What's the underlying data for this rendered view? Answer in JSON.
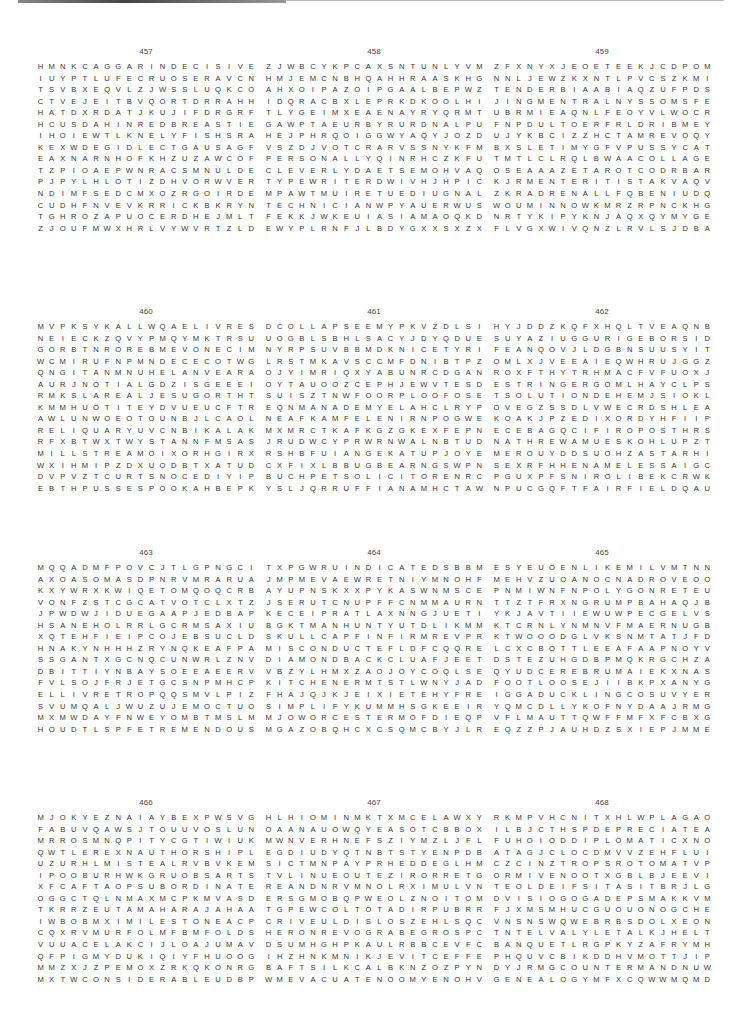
{
  "puzzles": [
    {
      "number": "457",
      "rows": [
        "HMNKCAGGARINDECISIVE",
        "IUYPTLUFECRUOSERAVCN",
        "TSVBXEQVLZJWSSLUQKCO",
        "CTVEJEITBVQORTDRRAHH",
        "HATDXRDATJKUJIFDRGRF",
        "HCUSDAHINREDBREASTIE",
        "IHOIEWTLKNELYFISHSRA",
        "KEXWDEGIDLECTGAUSAGF",
        "EAXNARNHOFKHZUZAWCOF",
        "TZPIOAEPWNRACSMNULDE",
        "PJPYLHLOTIZDHVORWVER",
        "NDIMFSEDCMXOZRGOIRDE",
        "CUDHFNVEVKRRICKBKRYN",
        "TGHROZAPUOCERDHEJMLT",
        "ZJOUFMWXHRLVYWVRTZLD"
      ]
    },
    {
      "number": "458",
      "rows": [
        "ZJWBCYKPCAXSNTUNLYVM",
        "HMJEMCNBHQAHHRAASKHG",
        "AHXOIPAZOIPGAALBEPWZ",
        "IDQRACBXLEPRKDKOOLHI",
        "TLYGEIMXEAENAYRYQRMT",
        "GAWPTAEURBYRURDNALPU",
        "HEJPHRQOIGGWYAQYJOZD",
        "VSZDJVOTCRARVSSNYKFM",
        "PERSONALLYQINRHCZKFU",
        "CLEVERLYDAETSEMOHVAQ",
        "TYPEWRITERDWIVHJHPIC",
        "MPAWTMUIRETUEDIUGNAL",
        "TECHNICIANWPYAUERWUS",
        "FEKKJWKEUIASIAMAOQKD",
        "EWYPLRNFJLBDYGXXSXZX"
      ]
    },
    {
      "number": "459",
      "rows": [
        "ZFXNYXJEOETEEKJCDPOM",
        "NNLJEWZKXNTLPVCSZKMI",
        "TENDERBIAABIAQZUFPDS",
        "JINGMENTRALNYSSOMSFE",
        "UBRMIEAQNLFEOYVLWOCR",
        "FNPDULTOERFRLDRIBMEY",
        "UJYKBCIZZHCTAMREVOQY",
        "BXSLETIMYGFVPUSSYCAT",
        "TMTLCLRQLBWAACOLLAGE",
        "OSEAAAZETAROTCODRBAR",
        "KJRMENTERITISTAKVAQV",
        "ZKRADRENALLFQBENIUDQ",
        "WOUMINNOWKMRZRPNCKHG",
        "NRTYKIPYKNJAQXQYMYGE",
        "FLVGXWIVQNZLRVLSJDBA"
      ]
    },
    {
      "number": "460",
      "rows": [
        "MVPKSYKALLWQAELIVRES",
        "NEIECKZQVYPMQYMKTRSU",
        "GORBTNROREBMEVONECIM",
        "WCMIRUFNPMNDECECOTWG",
        "QNGITANMNUHELANVEARA",
        "AURJNOTIALGDZISGEEEI",
        "RMKSLAREALJESUGORTHT",
        "KMMHUOTITEYDVUEUCFTR",
        "AWLUNWOEOTOUNBJLCAOL",
        "RELIQUARYUVCNBIKALAK",
        "RFXBTWXTWYSTANNFMSAS",
        "MILLSTREAMOIXORHGIRX",
        "WXIHMIPZDXUODBTXATUD",
        "DVPVZTCURTSNOCEDIYIP",
        "EBTHPUSSESPOOKAHBEPK"
      ]
    },
    {
      "number": "461",
      "rows": [
        "DCOLLAPSEEMYPKVZDLSI",
        "UOGBLSBHLSACYJDYQDUE",
        "NYRPSUVBBMDKNICETYRI",
        "LRSTMKAVSCCMFDNIBTPZ",
        "OJYIMRIQXYABUNRCDGAN",
        "OYTAUOOZCEPHJEWVTESD",
        "SUISZTNWFOORPLOOFOSE",
        "EQNMANADEMYELAHCLRYP",
        "NEAFKAMFELENIRNPOGWE",
        "MXMRCTKAFKGZGKEXFEPN",
        "JRUDWCYPRWRNWALNBTUD",
        "RSHBFUIANGEKATUPJOYE",
        "CXFIXLBBUGBEARNGSWPN",
        "BUCHPETSOLICITORENRC",
        "YSLJQRRUFFIANAMHCTAWY"
      ]
    },
    {
      "number": "462",
      "rows": [
        "HYJDDZKQFXHQLTVEAQNB",
        "SUYAZIUGGURIGEBORSID",
        "FEANQOVJLDGBNSUUSYIT",
        "OMLXJVEEAIEQWHRUJGGZ",
        "ROXFTHYTRHMACFVFUOXJ",
        "ESTRINGERGOMLHAYCLPS",
        "TSOLUTIONDEHEMJSIOKL",
        "OVEGZSSDLVWECRDSHLEA",
        "KOAKJPZEDIXORDYHFIIP",
        "ECEBAGQCIFIROPOSTHRS",
        "NATHREWAMUESKOHLUPZT",
        "MEROUYDDSUOHZASTARHI",
        "SEXRFHHENAMELESSAIGC",
        "PGUXPFSNIROLIBEKCRWK",
        "NPUCGQFTFAIRFIELDQAU"
      ]
    },
    {
      "number": "463",
      "rows": [
        "MQQADMFPOVCJTLGPNGCI",
        "AXOASOMASDPNRVMRARUA",
        "KXYWRXKWIQETOMQOQCRB",
        "VONFZSTCGCATVOTCLXTZ",
        "JPWDWJIDUEGAAPJEDBAP",
        "HSANEHOLRRLGCRMSAXIU",
        "XQTEHFIEIPCOJEBSUCLD",
        "HNAKYNHHHZRYNQKEAFPA",
        "SSGANTXGCNQCUNWRLZNV",
        "DBITTIYNBAYSOEEAEERV",
        "FVLSOJFRJETGCSNPMHCP",
        "ELLIVRETROPQQSMVLPIZ",
        "SVUMQALJWUZUJEMOCTUO",
        "MXMWDAYFNWEYOMBTMSLM",
        "HOUDTLSPFETREMENDOUS"
      ]
    },
    {
      "number": "464",
      "rows": [
        "TXPGWRUINDICATEDSBBM",
        "JMPMEVAEWRETNIYMNOHF",
        "AYUPNSKXXPYKASWNMSCE",
        "JSERUTCNUPFFCNMMAURN",
        "KECEIPRATLAXNNGJUETI",
        "BGKTMANHUNTYUTDLIKMM",
        "SKULLCAPFINFIRMREVPR",
        "MISCONDUCTEFLDFCQQRE",
        "DIAMONDBACKCLUAFJEET",
        "VBZYLHMXZAOJOYCOQLSE",
        "KITCHENERMTSTLWNYJAD",
        "FHAJQJKJEIXIETEHYFRE",
        "SIMPLIFYKUMMHSGKEEIR",
        "MJOWORCESTERMOFDIEQP",
        "MGAZOBQHCXCSQMCBYJLR"
      ]
    },
    {
      "number": "465",
      "rows": [
        "ESYEUOENLIKEMILVMTNN",
        "MEHVZUOANOCNADROVEOO",
        "PNMIWNFNPOLYGONRETEU",
        "TTZTFRXNGRUMPBAHAQJB",
        "YKJAVTIIEWUWPECGELVS",
        "KTCRNLYNMNVFMAERNUGB",
        "KTWOOODGLVKSNMTATJFD",
        "LCXCBOTTLEEAFAAPNOYV",
        "DSTEZUHGDBPMQKRGCHZA",
        "QYUDCEREBRUMAIEKXNAS",
        "FOOTLOOSEJIIBKPXANYG",
        "IGGADUCKLINGCOSUVYER",
        "YQMCDLLYKOFNYDAAJRMG",
        "VFLMAUTTQWFFMFXFCBXG",
        "EQZZPJAUHDZSXIEPJMME"
      ]
    },
    {
      "number": "466",
      "rows": [
        "MJOKYEZNAIAYBEXPWSVG",
        "FABUVQAWSJTOUUVOSLUN",
        "MRROSMNQPITYCGTIWIUK",
        "QWTLEREXNAUTHORSHIPL",
        "UZURHLMISTEALRVBVKEM",
        "IPOOBURHWKGRUOBSARTS",
        "XFCAFTAOPSUBORDINATE",
        "OGGCTQLNMAXMCPKMVASD",
        "TKRRZEUTAMAHARAJAHAA",
        "IWBOBMXIMILESTONEACP",
        "CQXRVMURFOLMFBMFOLDS",
        "VUUACELAKCIJLOAJUMAV",
        "QFPIGMYDUKIQIYFHUOOG",
        "MMZXJZPEMOXZRKQKONRG",
        "MXTWCONSIDERABLEUDBP"
      ]
    },
    {
      "number": "467",
      "rows": [
        "HLHIOMINMKTXMCELAWXY",
        "OAANAUOWQYEASOTCBBOX",
        "MWNVERHNEFSZIYMZLJFL",
        "EGDIUDYQTNBTSTYENPDB",
        "SICTMNPAYPRHEDDEGLHM",
        "TVLINUEOUTEZIRORRETG",
        "REANDNRVMNOLRXIMULVN",
        "ERSGMOBQPWEOLZNOITOM",
        "TGPEWCOLTOTADIRPUBRR",
        "CRIVEULDISLOSZEHLSQC",
        "HERONREVOGRABEGROSPC",
        "DSUMHGHPKAULRBBCEVFC",
        "IHZHNKMNIKJEVITCEFFE",
        "BAFTSILKCALBKNZOZPYN",
        "WMEVACUATENOOMYENOHV"
      ]
    },
    {
      "number": "468",
      "rows": [
        "RKMPVHCNITXHLWPLAGAO",
        "ILBJCTHSPDEPRECIATEA",
        "FUHOIODDIPLOMATICXNO",
        "ATAGJCLOCDMVVZEHFLUI",
        "CZCINZTROPSROTOMATVP",
        "ORMIVENOOTXGBLBJEEVI",
        "TEOLDEIFSITASITBRJLG",
        "DVISIOGOGADEPSMAKKVM",
        "FJXMSMHUCGUOUONOGCHE",
        "VNSNSWQWEBRBSDOLXEON",
        "TNTELVALYLETALKJHELT",
        "BANQUETLRGPKYZAFRYMH",
        "PHQUVCBIKDDHVMOTTJIP",
        "DYJRMGCOUNTERMANDNUW",
        "GENEALOGYMFXCQWWMQMD"
      ]
    }
  ]
}
